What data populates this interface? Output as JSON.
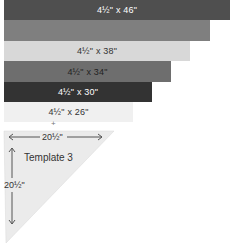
{
  "strips": [
    {
      "label": "4½\" x 46\"",
      "color": "#4f4f4f",
      "text_color": "#ffffff",
      "top": 0,
      "height": 20,
      "width": 226
    },
    {
      "label": "",
      "color": "#7f7f7f",
      "text_color": "#ffffff",
      "top": 20,
      "height": 21,
      "width": 206
    },
    {
      "label": "4½\" x 38\"",
      "color": "#d8d8d8",
      "text_color": "#333333",
      "top": 41,
      "height": 20,
      "width": 186
    },
    {
      "label": "4½\" x 34\"",
      "color": "#6e6e6e",
      "text_color": "#222222",
      "top": 61,
      "height": 21,
      "width": 167
    },
    {
      "label": "4½\" x 30\"",
      "color": "#333333",
      "text_color": "#ffffff",
      "top": 82,
      "height": 20,
      "width": 148
    },
    {
      "label": "4½\" x 26\"",
      "color": "#f0f0f0",
      "text_color": "#333333",
      "top": 102,
      "height": 20,
      "width": 129
    }
  ],
  "plus_sign": "+",
  "template": {
    "title": "Template 3",
    "width_label": "20½\"",
    "height_label": "20½\"",
    "fill": "#ebebeb",
    "arrow_color": "#555555"
  }
}
